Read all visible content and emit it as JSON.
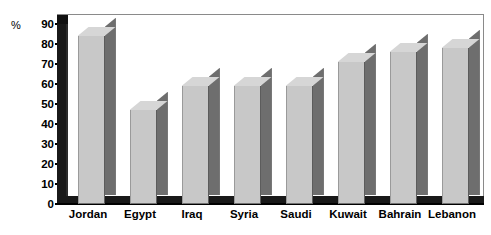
{
  "chart_data": {
    "type": "bar",
    "title": "",
    "subtitle": "",
    "xlabel": "",
    "ylabel": "%",
    "unit_label": "%",
    "categories": [
      "Jordan",
      "Egypt",
      "Iraq",
      "Syria",
      "Saudi",
      "Kuwait",
      "Bahrain",
      "Lebanon"
    ],
    "values": [
      84,
      47,
      59,
      59,
      59,
      71,
      76,
      78
    ],
    "ylim": [
      0,
      90
    ],
    "ytick_step": 10,
    "ytick_labels": [
      "90",
      "80",
      "70",
      "60",
      "50",
      "40",
      "30",
      "20",
      "10",
      "0"
    ],
    "ytick_values": [
      90,
      80,
      70,
      60,
      50,
      40,
      30,
      20,
      10,
      0
    ],
    "grid": false,
    "legend": false,
    "legend_position": "none",
    "style": "3d-column",
    "annotations": [],
    "colors": {
      "bar_front": "#c8c8c8",
      "bar_side": "#6e6e6e",
      "bar_top": "#d6d6d6",
      "wall": "#191919",
      "floor": "#191919",
      "background": "#ffffff",
      "text": "#000000",
      "frame": "#8a8a8a"
    }
  },
  "axis": {
    "unit": "%",
    "ticks": [
      {
        "label": "90"
      },
      {
        "label": "80"
      },
      {
        "label": "70"
      },
      {
        "label": "60"
      },
      {
        "label": "50"
      },
      {
        "label": "40"
      },
      {
        "label": "30"
      },
      {
        "label": "20"
      },
      {
        "label": "10"
      },
      {
        "label": "0"
      }
    ]
  },
  "bars": [
    {
      "label": "Jordan",
      "value": 84
    },
    {
      "label": "Egypt",
      "value": 47
    },
    {
      "label": "Iraq",
      "value": 59
    },
    {
      "label": "Syria",
      "value": 59
    },
    {
      "label": "Saudi",
      "value": 59
    },
    {
      "label": "Kuwait",
      "value": 71
    },
    {
      "label": "Bahrain",
      "value": 76
    },
    {
      "label": "Lebanon",
      "value": 78
    }
  ]
}
